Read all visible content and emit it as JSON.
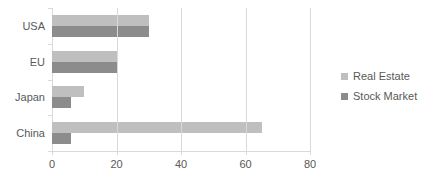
{
  "chart_data": {
    "type": "bar",
    "orientation": "horizontal",
    "title": "",
    "xlabel": "",
    "ylabel": "",
    "categories": [
      "USA",
      "EU",
      "Japan",
      "China"
    ],
    "series": [
      {
        "name": "Real Estate",
        "color": "#bfbfbf",
        "values": [
          30,
          20,
          10,
          65
        ]
      },
      {
        "name": "Stock Market",
        "color": "#8c8c8c",
        "values": [
          30,
          20,
          6,
          6
        ]
      }
    ],
    "xlim": [
      0,
      80
    ],
    "xticks": [
      0,
      20,
      40,
      60,
      80
    ],
    "xtick_labels": [
      "0",
      "20",
      "40",
      "60",
      "80"
    ],
    "grid": true,
    "grid_axis": "x",
    "legend": {
      "position": "right",
      "entries": [
        {
          "label": "Real Estate",
          "color": "#bfbfbf"
        },
        {
          "label": "Stock Market",
          "color": "#8c8c8c"
        }
      ]
    },
    "background_color": "#ffffff",
    "axis_color": "#d9d9d9",
    "text_color": "#595959"
  }
}
